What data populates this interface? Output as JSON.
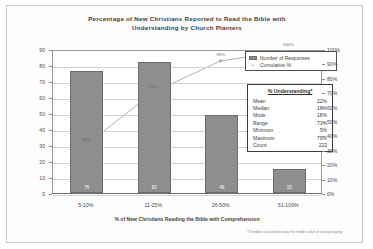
{
  "chart_data": {
    "type": "bar",
    "title": "Percentage of New Christians Reported to Read the Bible with Understanding by Church Planters",
    "title_line1": "Percentage of New Christians Reported to Read the Bible with",
    "title_line2": "Understanding by Church Planters",
    "xlabel": "% of New Christians Reading the Bible with Comprehension",
    "ylabel": "",
    "categories": [
      "5-10%",
      "11-25%",
      "26-50%",
      "51-100%"
    ],
    "series": [
      {
        "name": "Number of Responses",
        "type": "bar",
        "values": [
          76,
          82,
          49,
          15
        ],
        "axis": "left"
      },
      {
        "name": "Cumulative %",
        "type": "line",
        "values": [
          34,
          71,
          93,
          100
        ],
        "value_labels": [
          "34%",
          "71%",
          "93%",
          "100%"
        ],
        "axis": "right"
      }
    ],
    "ylim": [
      0,
      90
    ],
    "ylim_right": [
      0,
      100
    ],
    "yticks": [
      "90",
      "80",
      "70",
      "60",
      "50",
      "40",
      "30",
      "20",
      "10",
      "0"
    ],
    "yticks_right": [
      "100%",
      "90%",
      "80%",
      "70%",
      "60%",
      "50%",
      "40%",
      "30%",
      "20%",
      "10%",
      "0%"
    ],
    "grid": true,
    "legend_position": "top-right",
    "footnote": "*Trendline calculated using the middle value of each grouping",
    "colors": {
      "bar_fill": "#8e8e8e",
      "bar_border": "#6d6d6d",
      "line": "#b0b0b0",
      "grid": "#d2d2d2",
      "axis": "#6f6f6f",
      "text": "#3d3d3d"
    }
  },
  "legend": {
    "items": [
      {
        "label": "Number of Responses",
        "marker": "swatch"
      },
      {
        "label": "Cumulative %",
        "marker": "point"
      }
    ]
  },
  "stats_table": {
    "title": "% Understanding*",
    "rows": [
      {
        "label": "Mean",
        "value": "22%"
      },
      {
        "label": "Median",
        "value": "18%"
      },
      {
        "label": "Mode",
        "value": "18%"
      },
      {
        "label": "Range",
        "value": "71%"
      },
      {
        "label": "Minimum",
        "value": "5%"
      },
      {
        "label": "Maximum",
        "value": "76%"
      },
      {
        "label": "Count",
        "value": "222"
      }
    ]
  }
}
